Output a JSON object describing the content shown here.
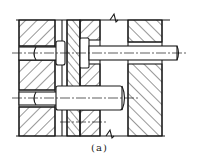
{
  "figure": {
    "caption": "(a)",
    "line_color": "#1a1a1a",
    "background": "#ffffff"
  }
}
